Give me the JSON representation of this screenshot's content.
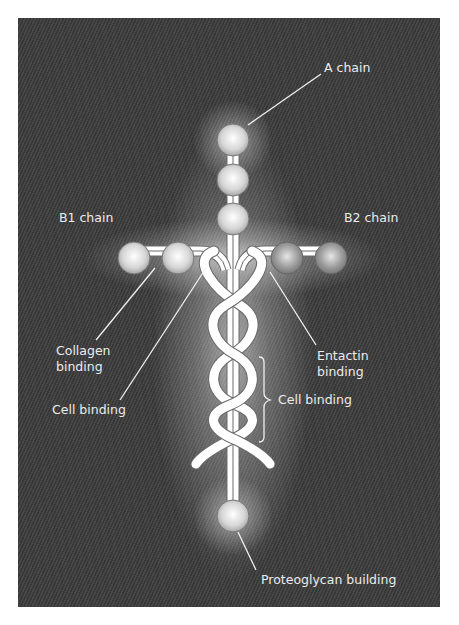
{
  "diagram": {
    "chains": {
      "a": "A chain",
      "b1": "B1 chain",
      "b2": "B2 chain"
    },
    "binding_sites": {
      "collagen": [
        "Collagen",
        "binding"
      ],
      "cell_left": "Cell binding",
      "entactin": [
        "Entactin",
        "binding"
      ],
      "cell_helix": "Cell binding",
      "proteoglycan": "Proteoglycan building"
    },
    "colors": {
      "background": "#3d3d3d",
      "glow": "#ffffff",
      "strand": "#ffffff",
      "strand_outline": "#6a6a6a",
      "sphere_light": "#d8d8d8",
      "sphere_dark": "#8a8a8a",
      "label": "#ececec"
    }
  }
}
